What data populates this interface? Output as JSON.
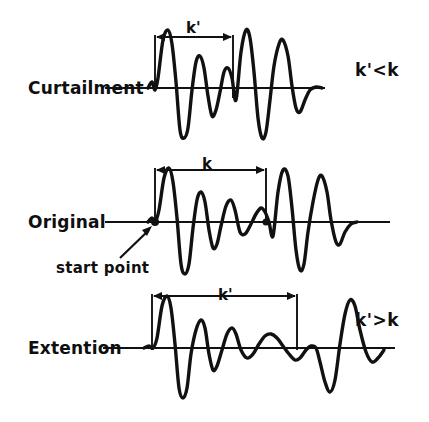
{
  "figure": {
    "background": "#ffffff",
    "ink_color": "#111111",
    "width": 429,
    "height": 422
  },
  "rows": [
    {
      "id": "curtailment",
      "label": "Curtailment",
      "dimension_label": "k'",
      "relation_label": "k'<k",
      "baseline_y": 88,
      "bracket_left_x": 155,
      "bracket_right_x": 233
    },
    {
      "id": "original",
      "label": "Original",
      "dimension_label": "k",
      "relation_label": "",
      "annotation_label": "start point",
      "baseline_y": 222,
      "bracket_left_x": 155,
      "bracket_right_x": 266
    },
    {
      "id": "extention",
      "label": "Extention",
      "dimension_label": "k'",
      "relation_label": "k'>k",
      "baseline_y": 348,
      "bracket_left_x": 152,
      "bracket_right_x": 297
    }
  ],
  "chart_data": {
    "type": "line",
    "title": "",
    "xlabel": "",
    "ylabel": "",
    "grid": false,
    "legend": null,
    "series": [
      {
        "name": "curtailment",
        "interval_label": "k'",
        "interval_pixels": 78,
        "baseline_y": 88,
        "points": [
          [
            148,
            0
          ],
          [
            152,
            6
          ],
          [
            155,
            -2
          ],
          [
            158,
            10
          ],
          [
            163,
            48
          ],
          [
            168,
            58
          ],
          [
            172,
            44
          ],
          [
            176,
            6
          ],
          [
            180,
            -42
          ],
          [
            184,
            -50
          ],
          [
            188,
            -40
          ],
          [
            192,
            -2
          ],
          [
            196,
            26
          ],
          [
            200,
            32
          ],
          [
            204,
            20
          ],
          [
            208,
            -8
          ],
          [
            212,
            -28
          ],
          [
            216,
            -22
          ],
          [
            220,
            -4
          ],
          [
            224,
            16
          ],
          [
            228,
            20
          ],
          [
            232,
            10
          ],
          [
            236,
            -12
          ],
          [
            241,
            36
          ],
          [
            246,
            58
          ],
          [
            250,
            50
          ],
          [
            254,
            16
          ],
          [
            258,
            -30
          ],
          [
            262,
            -50
          ],
          [
            266,
            -44
          ],
          [
            270,
            -12
          ],
          [
            274,
            22
          ],
          [
            279,
            44
          ],
          [
            283,
            48
          ],
          [
            288,
            32
          ],
          [
            292,
            2
          ],
          [
            296,
            -20
          ],
          [
            300,
            -24
          ],
          [
            305,
            -12
          ],
          [
            310,
            -2
          ],
          [
            316,
            1
          ],
          [
            322,
            0
          ]
        ]
      },
      {
        "name": "original",
        "interval_label": "k",
        "interval_pixels": 111,
        "baseline_y": 222,
        "points": [
          [
            148,
            0
          ],
          [
            152,
            4
          ],
          [
            155,
            0
          ],
          [
            159,
            12
          ],
          [
            164,
            44
          ],
          [
            169,
            54
          ],
          [
            173,
            40
          ],
          [
            177,
            4
          ],
          [
            181,
            -42
          ],
          [
            185,
            -52
          ],
          [
            189,
            -42
          ],
          [
            193,
            -6
          ],
          [
            197,
            22
          ],
          [
            201,
            30
          ],
          [
            205,
            20
          ],
          [
            209,
            -8
          ],
          [
            213,
            -26
          ],
          [
            217,
            -22
          ],
          [
            221,
            -4
          ],
          [
            226,
            16
          ],
          [
            231,
            22
          ],
          [
            235,
            12
          ],
          [
            240,
            -10
          ],
          [
            245,
            -12
          ],
          [
            250,
            -4
          ],
          [
            256,
            8
          ],
          [
            261,
            14
          ],
          [
            265,
            10
          ],
          [
            269,
            0
          ],
          [
            273,
            -14
          ],
          [
            278,
            30
          ],
          [
            283,
            52
          ],
          [
            288,
            46
          ],
          [
            292,
            14
          ],
          [
            296,
            -28
          ],
          [
            300,
            -48
          ],
          [
            304,
            -42
          ],
          [
            308,
            -10
          ],
          [
            313,
            20
          ],
          [
            318,
            42
          ],
          [
            322,
            46
          ],
          [
            327,
            30
          ],
          [
            331,
            2
          ],
          [
            336,
            -20
          ],
          [
            340,
            -22
          ],
          [
            345,
            -10
          ],
          [
            351,
            -2
          ],
          [
            357,
            0
          ]
        ]
      },
      {
        "name": "extention",
        "interval_label": "k'",
        "interval_pixels": 145,
        "baseline_y": 348,
        "points": [
          [
            144,
            0
          ],
          [
            149,
            2
          ],
          [
            153,
            0
          ],
          [
            157,
            10
          ],
          [
            162,
            42
          ],
          [
            167,
            52
          ],
          [
            171,
            40
          ],
          [
            175,
            4
          ],
          [
            179,
            -40
          ],
          [
            183,
            -50
          ],
          [
            187,
            -40
          ],
          [
            191,
            -6
          ],
          [
            196,
            18
          ],
          [
            201,
            28
          ],
          [
            205,
            20
          ],
          [
            209,
            -6
          ],
          [
            213,
            -22
          ],
          [
            217,
            -18
          ],
          [
            222,
            -2
          ],
          [
            227,
            14
          ],
          [
            232,
            20
          ],
          [
            236,
            14
          ],
          [
            241,
            -2
          ],
          [
            247,
            -10
          ],
          [
            253,
            -6
          ],
          [
            259,
            4
          ],
          [
            265,
            12
          ],
          [
            271,
            14
          ],
          [
            277,
            10
          ],
          [
            283,
            2
          ],
          [
            289,
            -6
          ],
          [
            295,
            -12
          ],
          [
            300,
            -10
          ],
          [
            306,
            -2
          ],
          [
            311,
            2
          ],
          [
            316,
            0
          ],
          [
            320,
            -14
          ],
          [
            325,
            -34
          ],
          [
            330,
            -44
          ],
          [
            335,
            -32
          ],
          [
            340,
            4
          ],
          [
            345,
            34
          ],
          [
            350,
            48
          ],
          [
            355,
            42
          ],
          [
            360,
            18
          ],
          [
            366,
            -4
          ],
          [
            372,
            -14
          ],
          [
            378,
            -10
          ],
          [
            384,
            -2
          ]
        ]
      }
    ]
  }
}
